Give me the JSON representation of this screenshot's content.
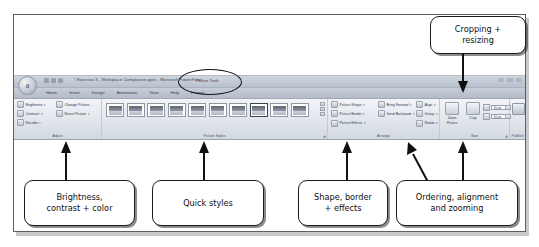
{
  "figure": {
    "kind": "annotated-screenshot"
  },
  "window": {
    "orb_label": "a",
    "title": "* Exercise 3 - Workplace Compliance.pptx  -  Microsoft PowerPoint",
    "contextual_label": "Picture Tools",
    "tabs": [
      {
        "label": "Home"
      },
      {
        "label": "Insert"
      },
      {
        "label": "Design"
      },
      {
        "label": "Animations"
      },
      {
        "label": "View"
      },
      {
        "label": "Help"
      },
      {
        "label": "Format"
      }
    ]
  },
  "ribbon": {
    "groups": [
      {
        "name": "Adjust"
      },
      {
        "name": "Picture Styles"
      },
      {
        "name": "Arrange"
      },
      {
        "name": "Size"
      },
      {
        "name": "Publish"
      }
    ],
    "adjust": {
      "left_column": [
        {
          "label": "Brightness",
          "caret": "▾"
        },
        {
          "label": "Contrast",
          "caret": "▾"
        },
        {
          "label": "Recolor",
          "caret": "▾"
        }
      ],
      "right_column": [
        {
          "label": "Change Picture...",
          "caret": ""
        },
        {
          "label": "Reset Picture",
          "caret": "▾"
        }
      ]
    },
    "picture_styles": {
      "thumbnail_count": 10,
      "selected_index": 7
    },
    "arrange": {
      "left_column": [
        {
          "label": "Picture Shape",
          "caret": "▾"
        },
        {
          "label": "Picture Border",
          "caret": "▾"
        },
        {
          "label": "Picture Effects",
          "caret": "▾"
        }
      ],
      "middle_column": [
        {
          "label": "Bring Forward",
          "caret": "▾"
        },
        {
          "label": "Send Backward",
          "caret": "▾"
        }
      ],
      "right_column": [
        {
          "label": "Align",
          "caret": "▾"
        },
        {
          "label": "Group",
          "caret": "▾"
        },
        {
          "label": "Rotate",
          "caret": "▾"
        }
      ]
    },
    "size": {
      "zoom_button": "Zoom Picture",
      "crop_button": "Crop",
      "height_value": "10 pc",
      "width_value": "10 pc"
    },
    "publish": {
      "button": "Preview",
      "caret": "▾"
    }
  },
  "annotations": [
    {
      "id": "cropping",
      "text": "Cropping +\nresizing"
    },
    {
      "id": "brightness",
      "text": "Brightness,\ncontrast + color"
    },
    {
      "id": "quick",
      "text": "Quick styles"
    },
    {
      "id": "shape",
      "text": "Shape, border\n+ effects"
    },
    {
      "id": "ordering",
      "text": "Ordering, alignment\nand zooming"
    }
  ],
  "colors": {
    "callout_border": "#1c1c1c",
    "frame_border": "#5d5f63",
    "ribbon_bg": "#dfe4ea",
    "highlight_ellipse": "#111111"
  }
}
